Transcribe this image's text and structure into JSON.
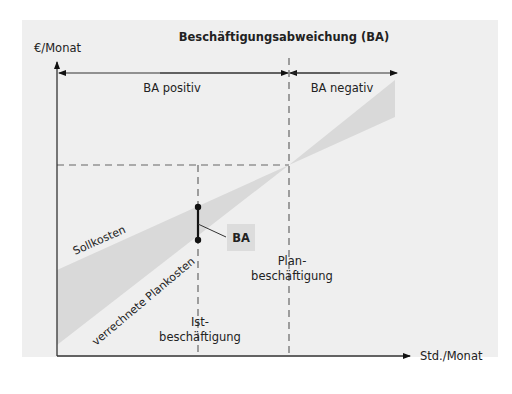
{
  "title": "Beschäftigungsabweichung (BA)",
  "axes": {
    "y_label": "€/Monat",
    "x_label": "Std./Monat"
  },
  "regions": {
    "positive": "BA positiv",
    "negative": "BA negativ"
  },
  "lines": {
    "sollkosten": "Sollkosten",
    "verrechnete_plankosten": "verrechnete Plankosten"
  },
  "markers": {
    "ist_line1": "Ist-",
    "ist_line2": "beschäftigung",
    "plan_line1": "Plan-",
    "plan_line2": "beschäftigung",
    "ba_callout": "BA"
  },
  "colors": {
    "panel": "#efefef",
    "wedge": "#d9d9d9",
    "line": "#333333",
    "dash": "#666666",
    "callout_bg": "#dcdcdc"
  }
}
